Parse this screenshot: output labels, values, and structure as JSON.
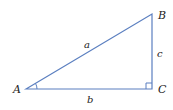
{
  "diagram": {
    "type": "right-triangle",
    "line_color": "#5b7fc0",
    "vertices": [
      {
        "name": "A",
        "x": 26,
        "y": 89,
        "label_x": 13,
        "label_y": 93
      },
      {
        "name": "B",
        "x": 152,
        "y": 14,
        "label_x": 158,
        "label_y": 19
      },
      {
        "name": "C",
        "x": 152,
        "y": 89,
        "label_x": 158,
        "label_y": 93
      }
    ],
    "sides": [
      {
        "name": "a",
        "from": "A",
        "to": "B",
        "label_x": 84,
        "label_y": 48
      },
      {
        "name": "b",
        "from": "A",
        "to": "C",
        "label_x": 87,
        "label_y": 103
      },
      {
        "name": "c",
        "from": "B",
        "to": "C",
        "label_x": 157,
        "label_y": 57
      }
    ],
    "angle_marker": {
      "vertex": "A"
    },
    "right_angle_marker": {
      "vertex": "C"
    }
  }
}
